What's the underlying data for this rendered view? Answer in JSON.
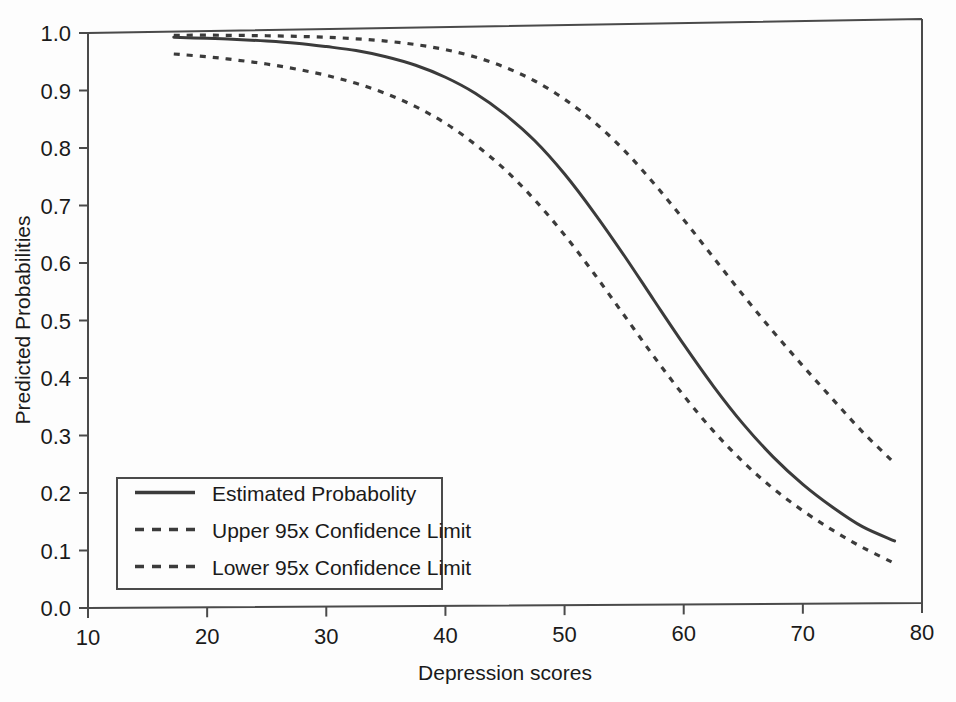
{
  "chart_data": {
    "type": "line",
    "title": "",
    "xlabel": "Depression scores",
    "ylabel": "Predicted Probabilities",
    "xlim": [
      10,
      80
    ],
    "ylim": [
      0.0,
      1.0
    ],
    "xticks": [
      "10",
      "20",
      "30",
      "40",
      "50",
      "60",
      "70",
      "80"
    ],
    "xtick_values": [
      10,
      20,
      30,
      40,
      50,
      60,
      70,
      80
    ],
    "yticks": [
      "0.0",
      "0.1",
      "0.2",
      "0.3",
      "0.4",
      "0.5",
      "0.6",
      "0.7",
      "0.8",
      "0.9",
      "1.0"
    ],
    "ytick_values": [
      0.0,
      0.1,
      0.2,
      0.3,
      0.4,
      0.5,
      0.6,
      0.7,
      0.8,
      0.9,
      1.0
    ],
    "grid": false,
    "legend_position": "lower-left-inside",
    "x": [
      17.2,
      20,
      22.5,
      25,
      27.5,
      30,
      32.5,
      35,
      37.5,
      40,
      42.5,
      45,
      47.5,
      50,
      52.5,
      55,
      57.5,
      60,
      62.5,
      65,
      67.5,
      70,
      72.5,
      75,
      77.7
    ],
    "series": [
      {
        "name": "Estimated Probabolity",
        "style": "solid",
        "color": "#3b3b3b",
        "values": [
          0.992,
          0.99,
          0.988,
          0.985,
          0.981,
          0.975,
          0.968,
          0.957,
          0.942,
          0.921,
          0.893,
          0.856,
          0.81,
          0.752,
          0.684,
          0.61,
          0.532,
          0.455,
          0.382,
          0.316,
          0.259,
          0.211,
          0.171,
          0.137,
          0.112
        ]
      },
      {
        "name": "Upper 95x Confidence Limit",
        "style": "dashed",
        "color": "#3b3b3b",
        "values": [
          0.9955,
          0.9955,
          0.995,
          0.9942,
          0.993,
          0.9912,
          0.9884,
          0.9842,
          0.978,
          0.969,
          0.956,
          0.938,
          0.914,
          0.882,
          0.842,
          0.793,
          0.735,
          0.672,
          0.606,
          0.54,
          0.477,
          0.417,
          0.359,
          0.302,
          0.247
        ]
      },
      {
        "name": "Lower 95x Confidence Limit",
        "style": "dashed",
        "color": "#3b3b3b",
        "values": [
          0.963,
          0.958,
          0.952,
          0.945,
          0.936,
          0.925,
          0.911,
          0.893,
          0.87,
          0.841,
          0.804,
          0.76,
          0.707,
          0.646,
          0.578,
          0.506,
          0.434,
          0.366,
          0.304,
          0.25,
          0.204,
          0.165,
          0.131,
          0.101,
          0.073
        ]
      }
    ]
  },
  "plot": {
    "frame": {
      "left": 88,
      "right": 922,
      "top": 33,
      "bottom": 608
    },
    "skew_top_right_y": 14,
    "skew_bottom_right_y": -5,
    "legend_box": {
      "left": 117,
      "top": 478,
      "right": 442,
      "bottom": 589
    }
  },
  "legend": {
    "items": [
      {
        "label": "Estimated Probabolity",
        "style": "solid"
      },
      {
        "label": "Upper 95x Confidence Limit",
        "style": "dashed"
      },
      {
        "label": "Lower 95x Confidence Limit",
        "style": "dashed"
      }
    ]
  }
}
